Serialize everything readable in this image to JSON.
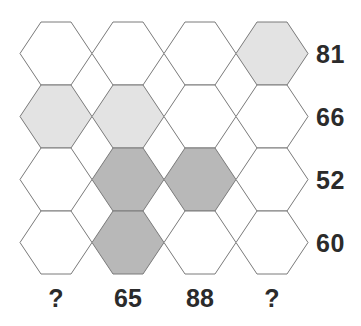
{
  "puzzle": {
    "type": "hexagon-grid-number-puzzle",
    "grid": {
      "rows": 4,
      "columns": 4,
      "orientation": "flat-top"
    },
    "colors": {
      "background": "#ffffff",
      "hex_empty": "#ffffff",
      "hex_light": "#e3e3e3",
      "hex_dark": "#b8b8b8",
      "stroke": "#7a7a7a",
      "text": "#2b2b2b"
    },
    "cells": [
      [
        {
          "fill": "empty"
        },
        {
          "fill": "empty"
        },
        {
          "fill": "empty"
        },
        {
          "fill": "light"
        }
      ],
      [
        {
          "fill": "light"
        },
        {
          "fill": "light"
        },
        {
          "fill": "empty"
        },
        {
          "fill": "empty"
        }
      ],
      [
        {
          "fill": "empty"
        },
        {
          "fill": "dark"
        },
        {
          "fill": "dark"
        },
        {
          "fill": "empty"
        }
      ],
      [
        {
          "fill": "empty"
        },
        {
          "fill": "dark"
        },
        {
          "fill": "empty"
        },
        {
          "fill": "empty"
        }
      ]
    ],
    "row_labels": [
      "81",
      "66",
      "52",
      "60"
    ],
    "column_labels": [
      "?",
      "65",
      "88",
      "?"
    ]
  },
  "chart_data": {
    "type": "heatmap",
    "title": "",
    "xlabel": "",
    "ylabel": "",
    "categories": [
      "?",
      "65",
      "88",
      "?"
    ],
    "rows": [
      "81",
      "66",
      "52",
      "60"
    ],
    "legend": [
      "empty",
      "light",
      "dark"
    ],
    "values": [
      [
        "empty",
        "empty",
        "empty",
        "light"
      ],
      [
        "light",
        "light",
        "empty",
        "empty"
      ],
      [
        "empty",
        "dark",
        "dark",
        "empty"
      ],
      [
        "empty",
        "dark",
        "empty",
        "empty"
      ]
    ]
  }
}
